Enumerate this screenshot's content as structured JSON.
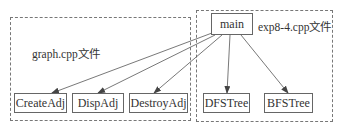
{
  "groups": [
    {
      "id": "graph",
      "label": "graph.cpp文件"
    },
    {
      "id": "exp",
      "label": "exp8-4.cpp文件"
    }
  ],
  "nodes": {
    "main": "main",
    "create_adj": "CreateAdj",
    "disp_adj": "DispAdj",
    "destroy_adj": "DestroyAdj",
    "dfs_tree": "DFSTree",
    "bfs_tree": "BFSTree"
  },
  "edges": [
    {
      "from": "main",
      "to": "CreateAdj"
    },
    {
      "from": "main",
      "to": "DispAdj"
    },
    {
      "from": "main",
      "to": "DestroyAdj"
    },
    {
      "from": "main",
      "to": "DFSTree"
    },
    {
      "from": "main",
      "to": "BFSTree"
    }
  ],
  "colors": {
    "line": "#555555",
    "border": "#666666",
    "dashed": "#777777"
  }
}
